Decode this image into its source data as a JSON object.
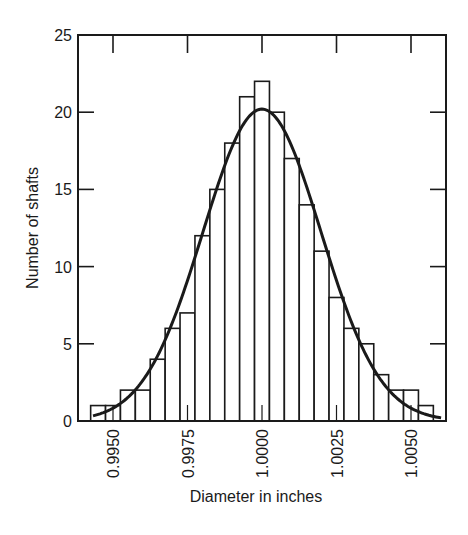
{
  "chart_data": {
    "type": "bar",
    "subtype": "histogram-with-normal-fit",
    "title": "",
    "xlabel": "Diameter in inches",
    "ylabel": "Number of shafts",
    "xlim": [
      0.99385,
      1.00625
    ],
    "ylim": [
      0,
      25
    ],
    "x_ticks": [
      0.995,
      0.9975,
      1.0,
      1.0025,
      1.005
    ],
    "x_tick_labels": [
      "0.9950",
      "0.9975",
      "1.0000",
      "1.0025",
      "1.0050"
    ],
    "y_ticks": [
      0,
      5,
      10,
      15,
      20,
      25
    ],
    "y_tick_labels": [
      "0",
      "5",
      "10",
      "15",
      "20",
      "25"
    ],
    "bin_width": 0.0005,
    "categories": [
      "0.9945",
      "0.9950",
      "0.9955",
      "0.9960",
      "0.9965",
      "0.9970",
      "0.9975",
      "0.9980",
      "0.9985",
      "0.9990",
      "0.9995",
      "1.0000",
      "1.0005",
      "1.0010",
      "1.0015",
      "1.0020",
      "1.0025",
      "1.0030",
      "1.0035",
      "1.0040",
      "1.0045",
      "1.0050",
      "1.0055"
    ],
    "values": [
      1,
      1,
      2,
      2,
      4,
      6,
      7,
      12,
      15,
      18,
      21,
      22,
      20,
      17,
      14,
      11,
      8,
      6,
      5,
      3,
      2,
      2,
      1
    ],
    "fit_curve": {
      "type": "normal",
      "mean": 1.0,
      "std": 0.00198,
      "peak": 20.2,
      "x_range": [
        0.99433,
        1.00601
      ]
    },
    "grid": false,
    "legend": null
  }
}
